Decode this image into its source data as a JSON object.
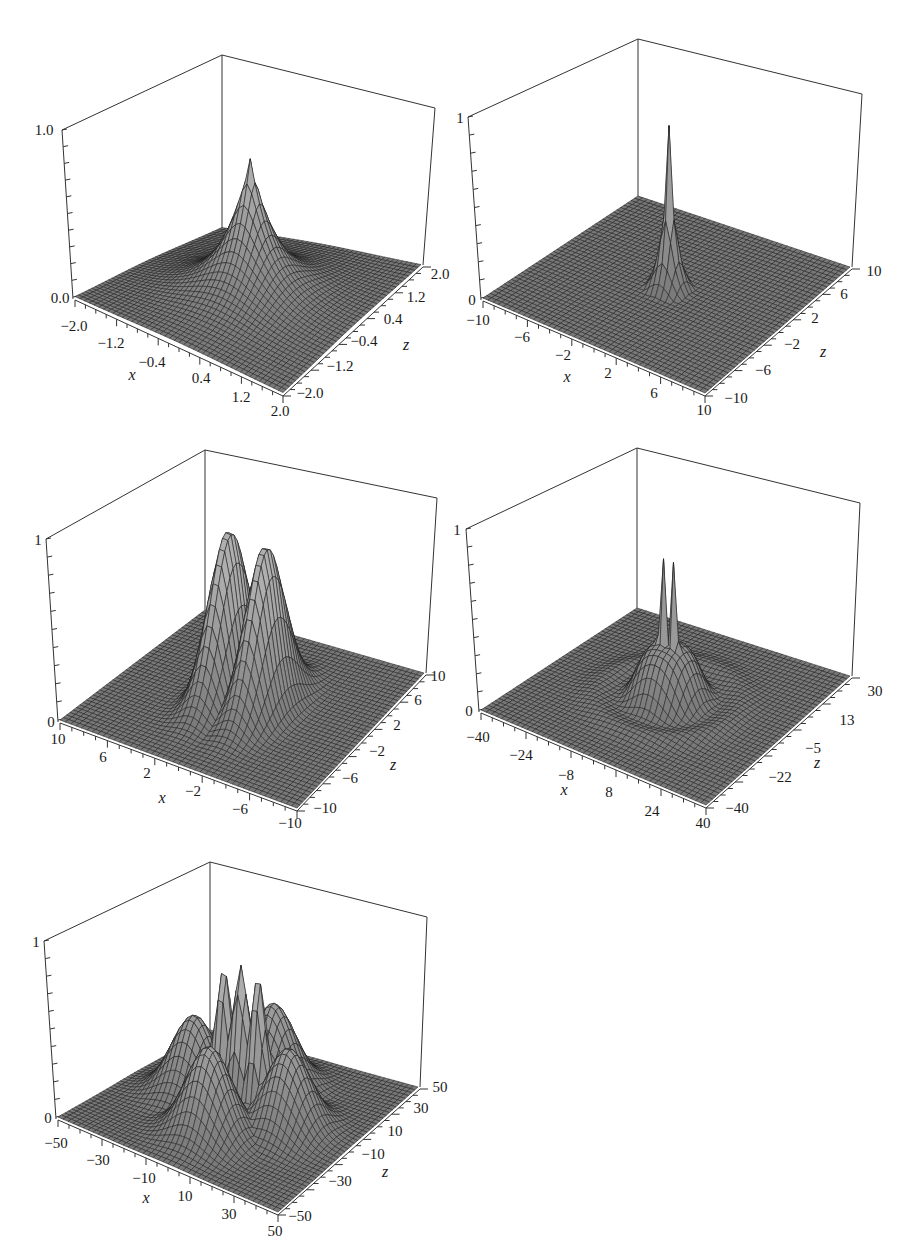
{
  "page": {
    "background": "#ffffff",
    "surface_fill": "#9a9a9a",
    "mesh_color": "#1e1e1e",
    "axis_color": "#333333"
  },
  "chart_data": [
    {
      "type": "surface3d",
      "id": "plot-1",
      "title": "",
      "xlabel": "x",
      "ylabel": "",
      "zlabel": "z",
      "x_range": [
        -2.0,
        2.0
      ],
      "z_range": [
        -2.0,
        2.0
      ],
      "y_range": [
        0.0,
        1.0
      ],
      "x_ticks": [
        "-2.0",
        "-1.2",
        "-0.4",
        "0.4",
        "1.2",
        "2.0"
      ],
      "z_ticks": [
        "-2.0",
        "-1.2",
        "-0.4",
        "0.4",
        "1.2",
        "2.0"
      ],
      "y_ticks": [
        "0.0",
        "1.0"
      ],
      "description": "Single cusp-like peak at origin reaching ~0.8, exponential decay",
      "shape": {
        "kind": "cusp",
        "peaks": [
          [
            0,
            0,
            0.82
          ]
        ],
        "width": 0.9
      },
      "grid_lines": 50
    },
    {
      "type": "surface3d",
      "id": "plot-2",
      "title": "",
      "xlabel": "x",
      "ylabel": "",
      "zlabel": "z",
      "x_range": [
        -10,
        10
      ],
      "z_range": [
        -10,
        10
      ],
      "y_range": [
        0,
        1
      ],
      "x_ticks": [
        "-10",
        "-6",
        "-2",
        "2",
        "6",
        "10"
      ],
      "z_ticks": [
        "-10",
        "-6",
        "-2",
        "2",
        "6",
        "10"
      ],
      "y_ticks": [
        "0",
        "1"
      ],
      "description": "Narrow sharp spike at origin reaching ~0.9 with a small ring dip",
      "shape": {
        "kind": "spike",
        "peaks": [
          [
            0,
            0,
            0.9
          ]
        ],
        "width": 1.2
      },
      "grid_lines": 60
    },
    {
      "type": "surface3d",
      "id": "plot-3",
      "title": "",
      "xlabel": "x",
      "ylabel": "",
      "zlabel": "z",
      "x_range": [
        10,
        -10
      ],
      "z_range": [
        -10,
        10
      ],
      "y_range": [
        0,
        1
      ],
      "x_ticks": [
        "10",
        "6",
        "2",
        "-2",
        "-6",
        "-10"
      ],
      "z_ticks": [
        "-10",
        "-6",
        "-2",
        "2",
        "6",
        "10"
      ],
      "y_ticks": [
        "0",
        "1"
      ],
      "description": "Two smooth ridge-like peaks, each reaching ~0.9, separated along x",
      "shape": {
        "kind": "twin",
        "peaks": [
          [
            -1.6,
            0,
            0.92
          ],
          [
            1.6,
            0,
            0.9
          ]
        ],
        "width": 2.6
      },
      "grid_lines": 50
    },
    {
      "type": "surface3d",
      "id": "plot-4",
      "title": "",
      "xlabel": "x",
      "ylabel": "",
      "zlabel": "z",
      "x_range": [
        -40,
        40
      ],
      "z_range": [
        -40,
        30
      ],
      "y_range": [
        0,
        1
      ],
      "x_ticks": [
        "-40",
        "-24",
        "-8",
        "8",
        "24",
        "40"
      ],
      "z_ticks": [
        "-40",
        "-22",
        "-5",
        "13",
        "30"
      ],
      "y_ticks": [
        "0",
        "1"
      ],
      "description": "Two sharp central spikes ~0.85 on a raised central mound with surrounding ring ripples",
      "shape": {
        "kind": "double-spike",
        "peaks": [
          [
            -2,
            0,
            0.85
          ],
          [
            2,
            0,
            0.85
          ]
        ],
        "width": 3
      },
      "grid_lines": 60
    },
    {
      "type": "surface3d",
      "id": "plot-5",
      "title": "",
      "xlabel": "x",
      "ylabel": "",
      "zlabel": "z",
      "x_range": [
        -50,
        50
      ],
      "z_range": [
        -50,
        50
      ],
      "y_range": [
        0,
        1
      ],
      "x_ticks": [
        "-50",
        "-30",
        "-10",
        "10",
        "30",
        "50"
      ],
      "z_ticks": [
        "-50",
        "-30",
        "-10",
        "10",
        "30",
        "50"
      ],
      "y_ticks": [
        "0",
        "1"
      ],
      "description": "Three tall central peaks ~0.8 surrounded by four lower lobes ~0.5",
      "shape": {
        "kind": "multi",
        "peaks": [
          [
            -8,
            0,
            0.78
          ],
          [
            0,
            0,
            0.83
          ],
          [
            8,
            0,
            0.8
          ],
          [
            0,
            -22,
            0.5
          ],
          [
            0,
            22,
            0.48
          ],
          [
            -22,
            0,
            0.45
          ],
          [
            22,
            0,
            0.45
          ]
        ],
        "width": 6
      },
      "grid_lines": 50
    }
  ],
  "plots": [
    {
      "geom": {
        "left": [
          62,
          130
        ],
        "back": [
          222,
          55
        ],
        "right": [
          435,
          108
        ],
        "base_left": [
          75,
          297
        ],
        "base_front": [
          283,
          393
        ],
        "base_right": [
          421,
          265
        ],
        "base_back": [
          222,
          228
        ]
      },
      "labels": {
        "y_max": {
          "text": "1.0",
          "pos": [
            44,
            130
          ]
        },
        "y_min": {
          "text": "0.0",
          "pos": [
            60,
            298
          ]
        },
        "x": [
          {
            "text": "−2.0",
            "pos": [
              74,
              326
            ]
          },
          {
            "text": "−1.2",
            "pos": [
              111,
              343
            ]
          },
          {
            "text": "−0.4",
            "pos": [
              152,
              362
            ]
          },
          {
            "text": "0.4",
            "pos": [
              201,
              378
            ]
          },
          {
            "text": "1.2",
            "pos": [
              241,
              397
            ]
          },
          {
            "text": "2.0",
            "pos": [
              280,
              411
            ]
          }
        ],
        "z": [
          {
            "text": "2.0",
            "pos": [
              440,
              274
            ]
          },
          {
            "text": "1.2",
            "pos": [
              416,
              297
            ]
          },
          {
            "text": "0.4",
            "pos": [
              393,
              319
            ]
          },
          {
            "text": "−0.4",
            "pos": [
              364,
              341
            ]
          },
          {
            "text": "−1.2",
            "pos": [
              340,
              366
            ]
          },
          {
            "text": "−2.0",
            "pos": [
              310,
              393
            ]
          }
        ],
        "x_title": {
          "text": "x",
          "pos": [
            132,
            375
          ]
        },
        "z_title": {
          "text": "z",
          "pos": [
            406,
            345
          ]
        }
      }
    },
    {
      "geom": {
        "left": [
          468,
          117
        ],
        "back": [
          638,
          39
        ],
        "right": [
          862,
          94
        ],
        "base_left": [
          483,
          298
        ],
        "base_front": [
          705,
          393
        ],
        "base_right": [
          850,
          267
        ],
        "base_back": [
          638,
          196
        ]
      },
      "labels": {
        "y_max": {
          "text": "1",
          "pos": [
            460,
            118
          ]
        },
        "y_min": {
          "text": "0",
          "pos": [
            472,
            300
          ]
        },
        "x": [
          {
            "text": "−10",
            "pos": [
              478,
              320
            ]
          },
          {
            "text": "−6",
            "pos": [
              522,
              337
            ]
          },
          {
            "text": "−2",
            "pos": [
              563,
              355
            ]
          },
          {
            "text": "2",
            "pos": [
              608,
              373
            ]
          },
          {
            "text": "6",
            "pos": [
              654,
              393
            ]
          },
          {
            "text": "10",
            "pos": [
              704,
              410
            ]
          }
        ],
        "z": [
          {
            "text": "10",
            "pos": [
              874,
              271
            ]
          },
          {
            "text": "6",
            "pos": [
              844,
              294
            ]
          },
          {
            "text": "2",
            "pos": [
              815,
              318
            ]
          },
          {
            "text": "−2",
            "pos": [
              792,
              344
            ]
          },
          {
            "text": "−6",
            "pos": [
              763,
              370
            ]
          },
          {
            "text": "−10",
            "pos": [
              736,
              398
            ]
          }
        ],
        "x_title": {
          "text": "x",
          "pos": [
            567,
            377
          ]
        },
        "z_title": {
          "text": "z",
          "pos": [
            823,
            352
          ]
        }
      }
    },
    {
      "geom": {
        "left": [
          46,
          539
        ],
        "back": [
          205,
          450
        ],
        "right": [
          437,
          498
        ],
        "base_left": [
          60,
          720
        ],
        "base_front": [
          297,
          808
        ],
        "base_right": [
          424,
          673
        ],
        "base_back": [
          205,
          610
        ]
      },
      "labels": {
        "y_max": {
          "text": "1",
          "pos": [
            38,
            540
          ]
        },
        "y_min": {
          "text": "0",
          "pos": [
            51,
            722
          ]
        },
        "x": [
          {
            "text": "10",
            "pos": [
              58,
              739
            ]
          },
          {
            "text": "6",
            "pos": [
              103,
              757
            ]
          },
          {
            "text": "2",
            "pos": [
              147,
              773
            ]
          },
          {
            "text": "−2",
            "pos": [
              193,
              791
            ]
          },
          {
            "text": "−6",
            "pos": [
              240,
              809
            ]
          },
          {
            "text": "−10",
            "pos": [
              290,
              823
            ]
          }
        ],
        "z": [
          {
            "text": "10",
            "pos": [
              438,
              676
            ]
          },
          {
            "text": "6",
            "pos": [
              418,
              700
            ]
          },
          {
            "text": "2",
            "pos": [
              397,
              725
            ]
          },
          {
            "text": "−2",
            "pos": [
              377,
              751
            ]
          },
          {
            "text": "−6",
            "pos": [
              350,
              778
            ]
          },
          {
            "text": "−10",
            "pos": [
              325,
              808
            ]
          }
        ],
        "x_title": {
          "text": "x",
          "pos": [
            162,
            798
          ]
        },
        "z_title": {
          "text": "z",
          "pos": [
            393,
            765
          ]
        }
      }
    },
    {
      "geom": {
        "left": [
          466,
          529
        ],
        "back": [
          637,
          448
        ],
        "right": [
          860,
          503
        ],
        "base_left": [
          481,
          710
        ],
        "base_front": [
          706,
          805
        ],
        "base_right": [
          850,
          676
        ],
        "base_back": [
          637,
          608
        ]
      },
      "labels": {
        "y_max": {
          "text": "1",
          "pos": [
            457,
            530
          ]
        },
        "y_min": {
          "text": "0",
          "pos": [
            469,
            711
          ]
        },
        "x": [
          {
            "text": "−40",
            "pos": [
              478,
              737
            ]
          },
          {
            "text": "−24",
            "pos": [
              521,
              755
            ]
          },
          {
            "text": "−8",
            "pos": [
              566,
              775
            ]
          },
          {
            "text": "8",
            "pos": [
              609,
              792
            ]
          },
          {
            "text": "24",
            "pos": [
              652,
              811
            ]
          },
          {
            "text": "40",
            "pos": [
              703,
              823
            ]
          }
        ],
        "z": [
          {
            "text": "30",
            "pos": [
              875,
              691
            ]
          },
          {
            "text": "13",
            "pos": [
              847,
              720
            ]
          },
          {
            "text": "−5",
            "pos": [
              813,
              748
            ]
          },
          {
            "text": "−22",
            "pos": [
              780,
              777
            ]
          },
          {
            "text": "−40",
            "pos": [
              737,
              808
            ]
          }
        ],
        "x_title": {
          "text": "x",
          "pos": [
            564,
            790
          ]
        },
        "z_title": {
          "text": "z",
          "pos": [
            817,
            763
          ]
        }
      }
    },
    {
      "geom": {
        "left": [
          44,
          941
        ],
        "back": [
          210,
          862
        ],
        "right": [
          427,
          917
        ],
        "base_left": [
          58,
          1117
        ],
        "base_front": [
          278,
          1212
        ],
        "base_right": [
          418,
          1087
        ],
        "base_back": [
          210,
          1030
        ]
      },
      "labels": {
        "y_max": {
          "text": "1",
          "pos": [
            36,
            942
          ]
        },
        "y_min": {
          "text": "0",
          "pos": [
            48,
            1118
          ]
        },
        "x": [
          {
            "text": "−50",
            "pos": [
              56,
              1143
            ]
          },
          {
            "text": "−30",
            "pos": [
              98,
              1160
            ]
          },
          {
            "text": "−10",
            "pos": [
              144,
              1178
            ]
          },
          {
            "text": "10",
            "pos": [
              185,
              1196
            ]
          },
          {
            "text": "30",
            "pos": [
              229,
              1214
            ]
          },
          {
            "text": "50",
            "pos": [
              275,
              1231
            ]
          }
        ],
        "z": [
          {
            "text": "50",
            "pos": [
              440,
              1087
            ]
          },
          {
            "text": "30",
            "pos": [
              421,
              1108
            ]
          },
          {
            "text": "10",
            "pos": [
              395,
              1131
            ]
          },
          {
            "text": "−10",
            "pos": [
              373,
              1154
            ]
          },
          {
            "text": "−30",
            "pos": [
              340,
              1181
            ]
          },
          {
            "text": "−50",
            "pos": [
              300,
              1216
            ]
          }
        ],
        "x_title": {
          "text": "x",
          "pos": [
            146,
            1198
          ]
        },
        "z_title": {
          "text": "z",
          "pos": [
            385,
            1172
          ]
        }
      }
    }
  ]
}
